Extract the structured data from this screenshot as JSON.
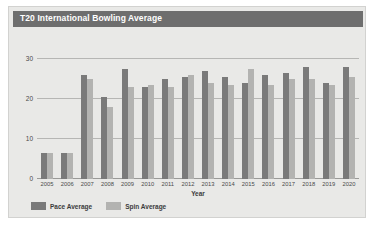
{
  "card": {
    "title": "T20 International Bowling Average"
  },
  "axes": {
    "xlabel": "Year",
    "ylabel": "",
    "yticks": [
      "0",
      "10",
      "20",
      "30"
    ]
  },
  "legend": {
    "items": [
      {
        "label": "Pace Average",
        "color": "#7a7a7a",
        "swatch_name": "legend-swatch-pace"
      },
      {
        "label": "Spin Average",
        "color": "#b3b3b1",
        "swatch_name": "legend-swatch-spin"
      }
    ]
  },
  "colors": {
    "card_background": "#e9e9e7",
    "title_bar": "#6e6e6e",
    "title_text": "#ffffff",
    "pace_bar": "#7a7a7a",
    "spin_bar": "#b3b3b1",
    "gridline": "#b6b6b4"
  },
  "chart_data": {
    "type": "bar",
    "title": "T20 International Bowling Average",
    "xlabel": "Year",
    "ylabel": "",
    "ylim": [
      0,
      32
    ],
    "yticks": [
      0,
      10,
      20,
      30
    ],
    "grid": true,
    "legend_position": "bottom-left",
    "categories": [
      "2005",
      "2006",
      "2007",
      "2008",
      "2009",
      "2010",
      "2011",
      "2012",
      "2013",
      "2014",
      "2015",
      "2016",
      "2017",
      "2018",
      "2019",
      "2020"
    ],
    "series": [
      {
        "name": "Pace Average",
        "color": "#7a7a7a",
        "values": [
          6.5,
          6.5,
          26.0,
          20.5,
          27.5,
          23.0,
          25.0,
          25.5,
          27.0,
          25.5,
          24.0,
          26.0,
          26.5,
          28.0,
          24.0,
          28.0
        ]
      },
      {
        "name": "Spin Average",
        "color": "#b3b3b1",
        "values": [
          6.5,
          6.5,
          25.0,
          18.0,
          23.0,
          23.5,
          23.0,
          26.0,
          24.0,
          23.5,
          27.5,
          23.5,
          25.0,
          25.0,
          23.5,
          25.5
        ]
      }
    ]
  }
}
